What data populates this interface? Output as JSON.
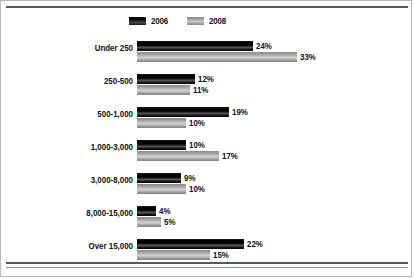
{
  "chart_data": {
    "type": "bar",
    "orientation": "horizontal",
    "title": "",
    "xlabel": "",
    "ylabel": "",
    "grid": false,
    "legend_position": "top-left",
    "xlim": [
      0,
      35
    ],
    "value_suffix": "%",
    "categories": [
      "Under 250",
      "250-500",
      "500-1,000",
      "1,000-3,000",
      "3,000-8,000",
      "8,000-15,000",
      "Over 15,000"
    ],
    "series": [
      {
        "name": "2006",
        "color": "#000000",
        "values": [
          24,
          12,
          19,
          10,
          9,
          4,
          22
        ],
        "labels": [
          "24%",
          "12%",
          "19%",
          "10%",
          "9%",
          "4%",
          "22%"
        ]
      },
      {
        "name": "2008",
        "color": "#b0b0b0",
        "values": [
          33,
          11,
          10,
          17,
          10,
          5,
          15
        ],
        "labels": [
          "33%",
          "11%",
          "10%",
          "17%",
          "10%",
          "5%",
          "15%"
        ]
      }
    ]
  },
  "legend": {
    "items": [
      {
        "label": "2006"
      },
      {
        "label": "2008"
      }
    ]
  },
  "scale": {
    "px_per_percent": 4.85,
    "bar_origin_x": 136
  }
}
